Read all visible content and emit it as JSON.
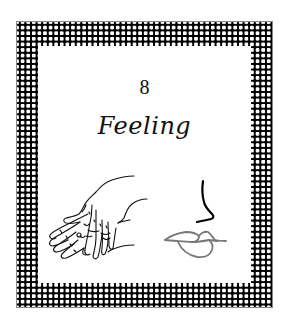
{
  "card": {
    "number": "8",
    "title": "Feeling"
  },
  "illustrations": {
    "left": "hands-icon",
    "right_top": "nose-icon",
    "right_bottom": "lips-icon"
  },
  "colors": {
    "border_pattern": "#000000",
    "background": "#ffffff",
    "text": "#111111",
    "nose_stroke": "#000000",
    "lips_stroke": "#7a7a7a"
  }
}
